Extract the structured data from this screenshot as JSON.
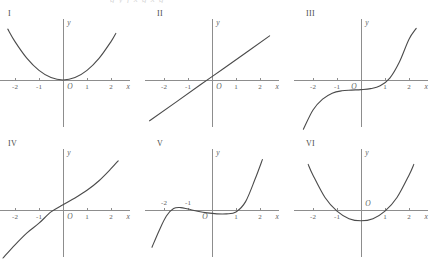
{
  "header": {
    "clipped_text": "g  y   f   x     g   x  g"
  },
  "axis": {
    "x_name": "x",
    "y_name": "y",
    "origin_label": "O",
    "tick_labels": [
      "-2",
      "-1",
      "1",
      "2"
    ],
    "tick_values": [
      -2,
      -1,
      1,
      2
    ],
    "x_range": [
      -2.8,
      2.8
    ],
    "y_range": [
      -2.2,
      2.2
    ],
    "axis_color": "#8d8d8d",
    "curve_color": "#4b4b4b",
    "label_color": "#5d5d5d",
    "background": "#ffffff"
  },
  "chart_data": {
    "type": "line",
    "title": "",
    "xlabel": "x",
    "ylabel": "y",
    "grid": false,
    "legend": "none",
    "xlim": [
      -2.8,
      2.8
    ],
    "ylim": [
      -2.2,
      2.2
    ],
    "panels": [
      {
        "label": "I",
        "description": "upward parabola with vertex at origin",
        "curve_kind": "parabola-vertex-origin",
        "x": [
          -2.3,
          -2.0,
          -1.5,
          -1.0,
          -0.5,
          0.0,
          0.5,
          1.0,
          1.5,
          2.0,
          2.2
        ],
        "y": [
          2.12,
          1.6,
          0.9,
          0.4,
          0.1,
          0.0,
          0.1,
          0.4,
          0.9,
          1.6,
          1.94
        ],
        "origin_label_pos": "below-right",
        "x_intercepts": [
          0
        ],
        "y_intercept": 0
      },
      {
        "label": "II",
        "description": "straight line with positive slope crossing x-axis just left of origin",
        "curve_kind": "line",
        "x": [
          -2.6,
          -1.5,
          -0.5,
          0.0,
          0.5,
          1.5,
          2.4
        ],
        "y": [
          -1.7,
          -0.92,
          -0.21,
          0.14,
          0.49,
          1.2,
          1.84
        ],
        "slope": 0.71,
        "y_intercept": 0.14,
        "x_intercepts": [
          -0.2
        ],
        "origin_label_pos": "below-right"
      },
      {
        "label": "III",
        "description": "cubic with flat inflection below axis near x = 0, rising steeply past x = 1.6",
        "curve_kind": "cubic-flat-inflection",
        "x": [
          -2.4,
          -2.0,
          -1.6,
          -1.2,
          -0.8,
          -0.4,
          0.0,
          0.4,
          0.8,
          1.2,
          1.6,
          2.0,
          2.3
        ],
        "y": [
          -2.05,
          -1.25,
          -0.8,
          -0.55,
          -0.45,
          -0.42,
          -0.4,
          -0.36,
          -0.24,
          0.08,
          0.75,
          1.7,
          2.15
        ],
        "x_intercepts": [
          1.45
        ],
        "y_intercept": -0.4,
        "origin_label_pos": "below-left"
      },
      {
        "label": "IV",
        "description": "odd increasing cube-root-like curve crossing axis near x = -0.45",
        "curve_kind": "odd-increasing",
        "x": [
          -2.5,
          -2.0,
          -1.5,
          -1.0,
          -0.5,
          0.0,
          0.5,
          1.0,
          1.5,
          2.0,
          2.3
        ],
        "y": [
          -2.0,
          -1.45,
          -0.95,
          -0.55,
          -0.08,
          0.22,
          0.5,
          0.82,
          1.22,
          1.72,
          2.05
        ],
        "x_intercepts": [
          -0.45
        ],
        "y_intercept": 0.22,
        "origin_label_pos": "below-right"
      },
      {
        "label": "V",
        "description": "quartic-like curve with local max near x = -1.5, shallow dip between 0 and 1, steep rise past x = 1.5",
        "curve_kind": "quartic-wiggle",
        "x": [
          -2.5,
          -2.2,
          -1.9,
          -1.6,
          -1.3,
          -1.0,
          -0.6,
          -0.2,
          0.2,
          0.6,
          1.0,
          1.4,
          1.8,
          2.1
        ],
        "y": [
          -1.55,
          -0.85,
          -0.25,
          0.06,
          0.1,
          0.04,
          -0.05,
          -0.12,
          -0.16,
          -0.16,
          -0.08,
          0.35,
          1.3,
          2.1
        ],
        "x_intercepts": [
          -1.8,
          -0.4,
          1.2
        ],
        "y_intercept": -0.14,
        "origin_label_pos": "below-left"
      },
      {
        "label": "VI",
        "description": "upward parabola with vertex below the x-axis, roots near x = -1 and x = 1",
        "curve_kind": "parabola-vertex-below",
        "x": [
          -2.2,
          -2.0,
          -1.5,
          -1.0,
          -0.5,
          0.0,
          0.5,
          1.0,
          1.5,
          2.0,
          2.2
        ],
        "y": [
          1.9,
          1.45,
          0.52,
          -0.05,
          -0.36,
          -0.45,
          -0.36,
          -0.05,
          0.52,
          1.45,
          1.9
        ],
        "x_intercepts": [
          -1.05,
          1.05
        ],
        "y_intercept": -0.45,
        "vertex": [
          0,
          -0.45
        ],
        "origin_label_pos": "above-right"
      }
    ]
  }
}
